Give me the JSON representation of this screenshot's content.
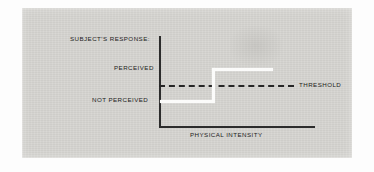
{
  "figure": {
    "plate_color": "#d2d1cd",
    "ink_color": "#1d1d1d",
    "curve_color": "#fbfbfa"
  },
  "labels": {
    "y_axis_title": "SUBJECT'S RESPONSE:",
    "y_tick_high": "PERCEIVED",
    "y_tick_low": "NOT PERCEIVED",
    "threshold": "THRESHOLD",
    "x_axis_title": "PHYSICAL INTENSITY"
  },
  "caption_ghost": "",
  "chart_data": {
    "type": "line",
    "title": "",
    "xlabel": "PHYSICAL INTENSITY",
    "ylabel": "SUBJECT'S RESPONSE:",
    "grid": false,
    "legend": "none",
    "xlim": [
      0,
      1
    ],
    "ylim": [
      0,
      1
    ],
    "ytick_labels": [
      "NOT PERCEIVED",
      "PERCEIVED"
    ],
    "ytick_values": [
      0.28,
      0.63
    ],
    "xtick_labels": [],
    "series": [
      {
        "name": "subject response",
        "style": "step",
        "color": "#fbfbfa",
        "x": [
          0.0,
          0.35,
          0.35,
          0.74
        ],
        "y": [
          0.28,
          0.28,
          0.63,
          0.63
        ]
      }
    ],
    "annotations": [
      {
        "name": "threshold",
        "label": "THRESHOLD",
        "type": "hline",
        "style": "dashed",
        "color": "#262626",
        "y": 0.45,
        "x_start": 0.0,
        "x_end": 0.88
      }
    ]
  }
}
